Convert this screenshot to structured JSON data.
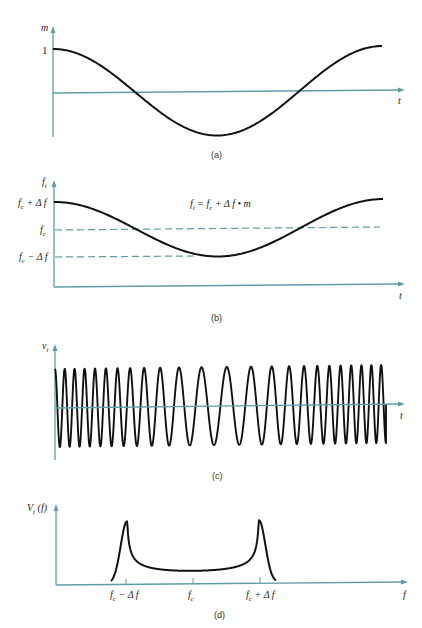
{
  "colors": {
    "axis": "#5e9ca8",
    "curve": "#111111",
    "background": "#ffffff"
  },
  "panels": {
    "a": {
      "caption": "(a)",
      "y_label": "m",
      "x_label": "t",
      "y_tick": "1",
      "description": "Modulating signal m(t): one cosine period starting at max 1"
    },
    "b": {
      "caption": "(b)",
      "y_label": "f",
      "y_label_sub": "t",
      "x_label": "t",
      "levels": [
        "f_c + Δf",
        "f_c",
        "f_c − Δf"
      ],
      "level_main": [
        "f",
        "f",
        "f"
      ],
      "level_sub": [
        "c",
        "c",
        "c"
      ],
      "level_tail": [
        " + Δ f",
        "",
        " − Δ f"
      ],
      "equation": "f",
      "equation_sub": "t",
      "equation_tail": " = f",
      "equation_sub2": "c",
      "equation_tail2": " + Δ f • m",
      "description": "Instantaneous frequency f_t = f_c + Δf·m"
    },
    "c": {
      "caption": "(c)",
      "y_label": "v",
      "y_label_sub": "t",
      "x_label": "t",
      "description": "FM waveform v_t with varying instantaneous frequency"
    },
    "d": {
      "caption": "(d)",
      "y_label": "V",
      "y_label_sub": "t",
      "y_label_tail": " (f)",
      "x_label": "f",
      "ticks": [
        "f_c − Δf",
        "f_c",
        "f_c + Δf"
      ],
      "tick_main": [
        "f",
        "f",
        "f"
      ],
      "tick_sub": [
        "c",
        "c",
        "c"
      ],
      "tick_tail": [
        " − Δ f",
        "",
        " + Δ f"
      ],
      "description": "FM spectrum V_t(f): peaks near f_c ± Δf, minimum at f_c"
    }
  }
}
